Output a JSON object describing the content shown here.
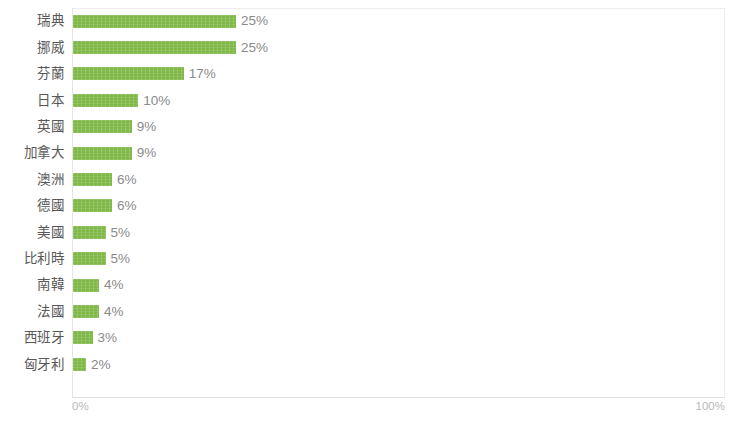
{
  "chart_data": {
    "type": "bar",
    "orientation": "horizontal",
    "title": "",
    "xlabel": "",
    "ylabel": "",
    "xlim": [
      0,
      100
    ],
    "grid": false,
    "legend": false,
    "bar_color": "#7fb846",
    "label_color": "#585858",
    "value_color": "#8a8a8a",
    "axis_color": "#b9b9b9",
    "value_suffix": "%",
    "axis_ticks": [
      "0%",
      "100%"
    ],
    "categories": [
      "瑞典",
      "挪威",
      "芬蘭",
      "日本",
      "英國",
      "加拿大",
      "澳洲",
      "德國",
      "美國",
      "比利時",
      "南韓",
      "法國",
      "西班牙",
      "匈牙利"
    ],
    "values": [
      25,
      25,
      17,
      10,
      9,
      9,
      6,
      6,
      5,
      5,
      4,
      4,
      3,
      2
    ],
    "value_labels": [
      "25%",
      "25%",
      "17%",
      "10%",
      "9%",
      "9%",
      "6%",
      "6%",
      "5%",
      "5%",
      "4%",
      "4%",
      "3%",
      "2%"
    ]
  },
  "axis": {
    "min_label": "0%",
    "max_label": "100%"
  }
}
